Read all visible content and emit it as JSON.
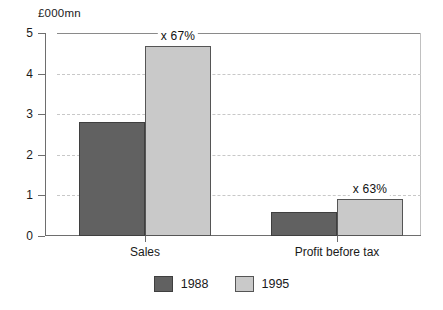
{
  "chart_data": {
    "type": "bar",
    "title": "",
    "subtitle": "",
    "xlabel": "",
    "ylabel": "£000mn",
    "categories": [
      "Sales",
      "Profit before tax"
    ],
    "series": [
      {
        "name": "1988",
        "color": "#616161",
        "values": [
          2.8,
          0.6
        ]
      },
      {
        "name": "1995",
        "color": "#c9c9c9",
        "values": [
          4.68,
          0.9
        ]
      }
    ],
    "ylim": [
      0,
      5
    ],
    "yticks": [
      "0",
      "1",
      "2",
      "3",
      "4",
      "5"
    ],
    "ytick_values": [
      0,
      1,
      2,
      3,
      4,
      5
    ],
    "grid": "horizontal-dashed",
    "legend_position": "bottom-center",
    "annotations": [
      {
        "text": "x 67%",
        "category": "Sales",
        "series": "1995"
      },
      {
        "text": "x 63%",
        "category": "Profit before tax",
        "series": "1995"
      }
    ]
  },
  "legend": {
    "items": [
      {
        "label": "1988",
        "color": "#616161"
      },
      {
        "label": "1995",
        "color": "#c9c9c9"
      }
    ]
  }
}
